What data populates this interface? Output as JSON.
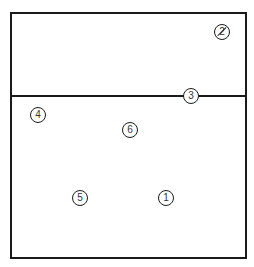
{
  "diagram": {
    "type": "volleyball-court-rotation",
    "court": {
      "border_color": "#1a1a1a",
      "net_label": ""
    },
    "players": [
      {
        "number": "1",
        "x": 166,
        "y": 198,
        "struck": false
      },
      {
        "number": "2",
        "x": 222,
        "y": 32,
        "struck": true
      },
      {
        "number": "3",
        "x": 191,
        "y": 96,
        "struck": false
      },
      {
        "number": "4",
        "x": 38,
        "y": 115,
        "struck": false
      },
      {
        "number": "5",
        "x": 80,
        "y": 198,
        "struck": false
      },
      {
        "number": "6",
        "x": 130,
        "y": 130,
        "struck": false
      }
    ]
  }
}
